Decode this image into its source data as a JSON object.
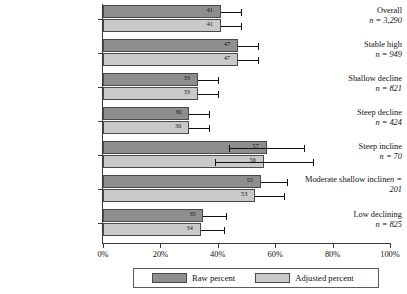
{
  "chart_data": {
    "type": "bar",
    "orientation": "horizontal",
    "title": "",
    "xlabel": "",
    "ylabel": "",
    "xlim": [
      0,
      100
    ],
    "xticks": [
      "0%",
      "20%",
      "40%",
      "60%",
      "80%",
      "100%"
    ],
    "xtick_values": [
      0,
      20,
      40,
      60,
      80,
      100
    ],
    "grid": false,
    "legend_position": "bottom",
    "categories": [
      "Overall",
      "Stable high",
      "Shallow decline",
      "Steep decline",
      "Steep incline",
      "Moderate shallow incline",
      "Low declining"
    ],
    "category_n": [
      "n = 3,290",
      "n = 949",
      "n = 821",
      "n = 424",
      "n = 70",
      "n = 201",
      "n = 825"
    ],
    "series": [
      {
        "name": "Raw percent",
        "color": "#8e8e8e",
        "values": [
          41,
          47,
          33,
          30,
          57,
          55,
          35
        ],
        "error_high": [
          48,
          54,
          40,
          37,
          70,
          64,
          43
        ]
      },
      {
        "name": "Adjusted percent",
        "color": "#c9c9c9",
        "values": [
          41,
          47,
          33,
          30,
          56,
          53,
          34
        ],
        "error_high": [
          48,
          54,
          40,
          37,
          73,
          63,
          42
        ]
      }
    ]
  },
  "legend": {
    "items": [
      {
        "label": "Raw percent",
        "color": "#8e8e8e"
      },
      {
        "label": "Adjusted percent",
        "color": "#c9c9c9"
      }
    ]
  }
}
